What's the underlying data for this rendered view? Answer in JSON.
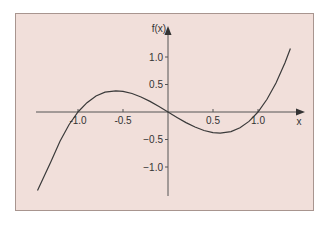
{
  "chart_data": {
    "type": "line",
    "title": "",
    "xlabel": "x",
    "ylabel": "f(x)",
    "function": "x^3 - x",
    "x_ticks": [
      -1.0,
      -0.5,
      0.5,
      1.0
    ],
    "x_tick_labels": [
      "-1.0",
      "-0.5",
      "0.5",
      "1.0"
    ],
    "y_ticks": [
      1.0,
      0.5,
      -0.5,
      -1.0
    ],
    "y_tick_labels": [
      "1.0",
      "0.5",
      "−0.5",
      "−1.0"
    ],
    "xlim": [
      -1.45,
      1.5
    ],
    "ylim": [
      -1.5,
      1.5
    ],
    "grid": false,
    "legend": null,
    "series": [
      {
        "name": "f(x)",
        "x": [
          -1.45,
          -1.3,
          -1.2,
          -1.1,
          -1.0,
          -0.9,
          -0.8,
          -0.7,
          -0.58,
          -0.5,
          -0.4,
          -0.3,
          -0.2,
          -0.1,
          0.0,
          0.1,
          0.2,
          0.3,
          0.4,
          0.5,
          0.58,
          0.7,
          0.8,
          0.9,
          1.0,
          1.1,
          1.2,
          1.3,
          1.36
        ],
        "values": [
          -1.43,
          -0.9,
          -0.53,
          -0.23,
          0.0,
          0.17,
          0.29,
          0.36,
          0.385,
          0.375,
          0.336,
          0.273,
          0.192,
          0.099,
          0.0,
          -0.099,
          -0.192,
          -0.273,
          -0.336,
          -0.375,
          -0.385,
          -0.357,
          -0.288,
          -0.171,
          0.0,
          0.231,
          0.528,
          0.897,
          1.155
        ]
      }
    ]
  },
  "axes": {
    "x_label": "x",
    "y_label": "f(x)"
  }
}
